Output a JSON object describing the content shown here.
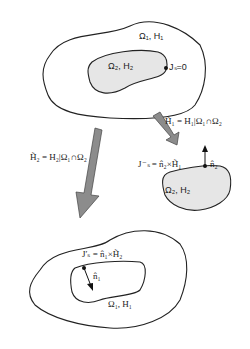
{
  "top_region": {
    "outer_label": "Ω₁, H₁",
    "inner_label": "Ω₂, H₂",
    "boundary_label": "Jₛ=0"
  },
  "right_region": {
    "equation_H1": "H̃₁ = H₁|Ω₁∩Ω₂",
    "equation_Js": "J⁻ₛ = n̂₂×H̃₁",
    "normal_label": "n̂₂",
    "region_label": "Ω₂, H₂"
  },
  "left_arrow": {
    "equation_H2": "H̃₂ = H₂|Ω₁∩Ω₂"
  },
  "bottom_region": {
    "equation_Js": "J′ₛ = n̂₁×H̃₂",
    "normal_label": "n̂₁",
    "region_label": "Ω₁, H₁"
  },
  "colors": {
    "inner_fill": "#e6e6e6",
    "arrow_fill": "#8c8c8c",
    "stroke": "#222222"
  }
}
